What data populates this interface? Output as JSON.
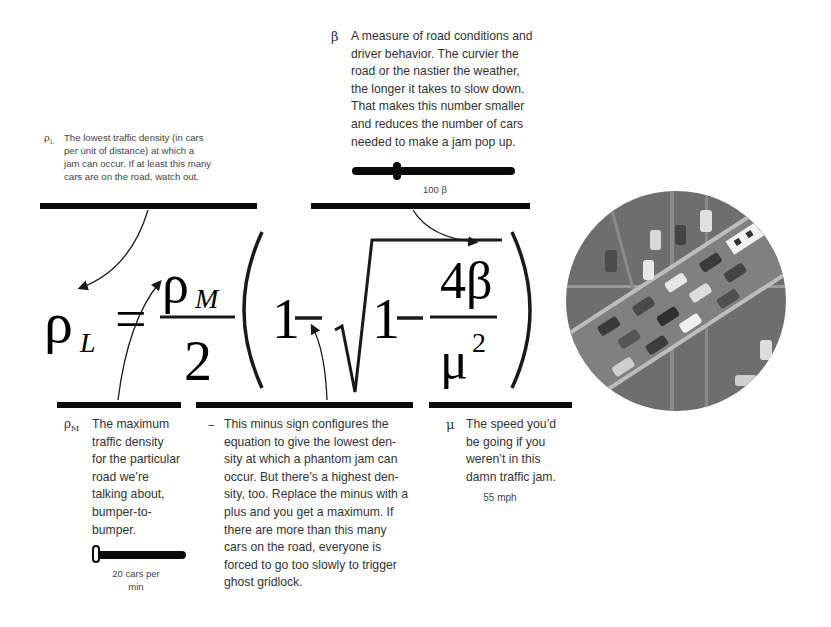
{
  "notes": {
    "rho_l": {
      "symbol": "ρL",
      "text": "The lowest traffic density (in cars\nper unit of distance) at which a\njam can occur.  If at least this many\ncars are on the road, watch out."
    },
    "beta": {
      "symbol": "β",
      "text": "A measure of road conditions and\ndriver behavior.  The curvier the\nroad or the nastier the weather,\nthe longer it takes to slow down.\nThat makes this number smaller\nand reduces the number of cars\nneeded to make a jam pop up.",
      "slider_value_label": "100 β"
    },
    "rho_m": {
      "symbol": "ρM",
      "text": "The maximum\ntraffic density\nfor the particular\nroad we’re\ntalking about,\nbumper-to-\nbumper.",
      "slider_value_label": "20 cars per\nmin"
    },
    "minus": {
      "symbol": "–",
      "text": "This minus sign configures the\nequation to give the lowest den-\nsity at which a phantom jam can\noccur.  But there’s a highest den-\nsity, too. Replace the minus with a\nplus and you get a maximum. If\nthere are more than this many\ncars on the road, everyone is\nforced to go too slowly to trigger\nghost gridlock."
    },
    "mu": {
      "symbol": "μ",
      "text": "The speed you’d\nbe going if you\nweren’t in this\ndamn traffic jam.",
      "value_label": "55 mph"
    }
  },
  "equation": {
    "lhs": "ρ",
    "lhs_sub": "L",
    "equals": "=",
    "numerator": "ρ",
    "numerator_sub": "M",
    "denominator": "2",
    "one_a": "1",
    "minus_a": "−",
    "one_b": "1",
    "minus_b": "−",
    "frac_num": "4β",
    "frac_den": "μ",
    "frac_den_exp": "2"
  },
  "image": {
    "description": "aerial view of highway traffic jam"
  },
  "colors": {
    "bar": "#0a0a0a",
    "text": "#333333",
    "photo_gray": "#7a7a7a"
  }
}
